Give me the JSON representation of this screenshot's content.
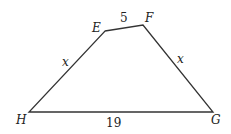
{
  "figure": {
    "shape": "quadrilateral EFGH",
    "line_color": "#333333",
    "vertices": [
      {
        "name": "E",
        "x": 105,
        "y": 31,
        "lx": 92,
        "ly": 32
      },
      {
        "name": "F",
        "x": 143,
        "y": 25,
        "lx": 145,
        "ly": 22
      },
      {
        "name": "G",
        "x": 213,
        "y": 112,
        "lx": 211,
        "ly": 124
      },
      {
        "name": "H",
        "x": 29,
        "y": 112,
        "lx": 16,
        "ly": 124
      }
    ],
    "sides": [
      {
        "from": "E",
        "to": "F",
        "label": "5",
        "lx": 120,
        "ly": 22,
        "italic": false
      },
      {
        "from": "F",
        "to": "G",
        "label": "x",
        "lx": 177,
        "ly": 63,
        "italic": true
      },
      {
        "from": "G",
        "to": "H",
        "label": "19",
        "lx": 106,
        "ly": 127,
        "italic": false
      },
      {
        "from": "H",
        "to": "E",
        "label": "x",
        "lx": 62,
        "ly": 66,
        "italic": true
      }
    ]
  }
}
